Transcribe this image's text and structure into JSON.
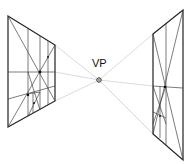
{
  "diagram": {
    "vp_label": "VP",
    "vanishing_point": {
      "x": 99,
      "y": 80
    },
    "left_panel": {
      "tl": [
        8,
        16
      ],
      "tr": [
        55,
        45
      ],
      "br": [
        55,
        101
      ],
      "bl": [
        8,
        127
      ]
    },
    "right_panel": {
      "tl": [
        153,
        34
      ],
      "tr": [
        183,
        10
      ],
      "br": [
        183,
        160
      ],
      "bl": [
        153,
        134
      ]
    },
    "colors": {
      "line": "#222222",
      "guide": "#cfcfcf"
    }
  }
}
